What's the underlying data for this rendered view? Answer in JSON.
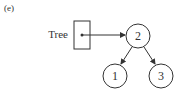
{
  "figure_label": "(e)",
  "pointer": {
    "label": "Tree"
  },
  "nodes": [
    {
      "id": "root",
      "value": "2"
    },
    {
      "id": "left",
      "value": "1"
    },
    {
      "id": "right",
      "value": "3"
    }
  ],
  "colors": {
    "stroke": "#333333",
    "background": "#ffffff"
  }
}
